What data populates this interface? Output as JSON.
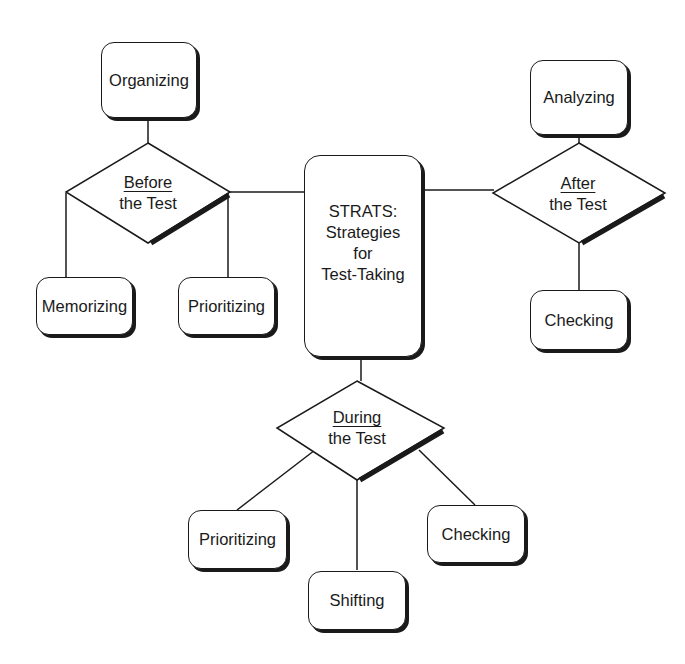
{
  "diagram": {
    "type": "concept-map",
    "center": {
      "label_lines": [
        "STRATS:",
        "Strategies",
        "for",
        "Test-Taking"
      ]
    },
    "phases": {
      "before": {
        "title": "Before",
        "subtitle": "the Test"
      },
      "during": {
        "title": "During",
        "subtitle": "the Test"
      },
      "after": {
        "title": "After",
        "subtitle": "the Test"
      }
    },
    "nodes": {
      "organizing": "Organizing",
      "memorizing": "Memorizing",
      "prioritizing_before": "Prioritizing",
      "analyzing": "Analyzing",
      "checking_after": "Checking",
      "prioritizing_during": "Prioritizing",
      "shifting": "Shifting",
      "checking_during": "Checking"
    },
    "edges": [
      [
        "Before the Test",
        "Organizing"
      ],
      [
        "Before the Test",
        "Memorizing"
      ],
      [
        "Before the Test",
        "Prioritizing"
      ],
      [
        "Before the Test",
        "STRATS"
      ],
      [
        "STRATS",
        "After the Test"
      ],
      [
        "After the Test",
        "Analyzing"
      ],
      [
        "After the Test",
        "Checking"
      ],
      [
        "STRATS",
        "During the Test"
      ],
      [
        "During the Test",
        "Prioritizing"
      ],
      [
        "During the Test",
        "Shifting"
      ],
      [
        "During the Test",
        "Checking"
      ]
    ],
    "colors": {
      "stroke": "#1a1a1a",
      "fill": "#ffffff"
    }
  }
}
